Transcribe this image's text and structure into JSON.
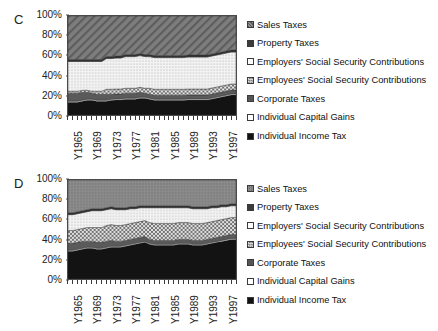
{
  "figure": {
    "panels": [
      {
        "id": "C",
        "letter": "C",
        "y_ticks": [
          "100%",
          "80%",
          "60%",
          "40%",
          "20%",
          "0%"
        ],
        "x_labels": [
          "Y1965",
          "Y1969",
          "Y1973",
          "Y1977",
          "Y1981",
          "Y1985",
          "Y1989",
          "Y1993",
          "Y1997"
        ]
      },
      {
        "id": "D",
        "letter": "D",
        "y_ticks": [
          "100%",
          "80%",
          "60%",
          "40%",
          "20%",
          "0%"
        ],
        "x_labels": [
          "Y1965",
          "Y1969",
          "Y1973",
          "Y1977",
          "Y1981",
          "Y1985",
          "Y1989",
          "Y1993",
          "Y1997"
        ]
      }
    ],
    "legend_items": [
      {
        "label": "Sales Taxes",
        "pattern": "diagonal-hatch",
        "color": "#6e6e6e"
      },
      {
        "label": "Property Taxes",
        "pattern": "solid-dark",
        "color": "#3b3b3b"
      },
      {
        "label": "Employers' Social Security Contributions",
        "pattern": "dotted-light",
        "color": "#f2f2f2"
      },
      {
        "label": "Employees' Social Security Contributions",
        "pattern": "checker",
        "color": "#a8a8a8"
      },
      {
        "label": "Corporate Taxes",
        "pattern": "solid-mid",
        "color": "#555555"
      },
      {
        "label": "Individual Capital Gains",
        "pattern": "white",
        "color": "#ffffff"
      },
      {
        "label": "Individual Income Tax",
        "pattern": "solid-black",
        "color": "#111111"
      }
    ]
  },
  "chart_data": [
    {
      "type": "area",
      "title": "C",
      "stacked": true,
      "normalized": true,
      "xlabel": "",
      "ylabel": "",
      "ylim": [
        0,
        100
      ],
      "grid": false,
      "legend_position": "right",
      "x": [
        "Y1965",
        "Y1966",
        "Y1967",
        "Y1968",
        "Y1969",
        "Y1970",
        "Y1971",
        "Y1972",
        "Y1973",
        "Y1974",
        "Y1975",
        "Y1976",
        "Y1977",
        "Y1978",
        "Y1979",
        "Y1980",
        "Y1981",
        "Y1982",
        "Y1983",
        "Y1984",
        "Y1985",
        "Y1986",
        "Y1987",
        "Y1988",
        "Y1989",
        "Y1990",
        "Y1991",
        "Y1992",
        "Y1993",
        "Y1994",
        "Y1995",
        "Y1996",
        "Y1997",
        "Y1998",
        "Y1999",
        "Y2000"
      ],
      "x_tick_labels": [
        "Y1965",
        "Y1969",
        "Y1973",
        "Y1977",
        "Y1981",
        "Y1985",
        "Y1989",
        "Y1993",
        "Y1997"
      ],
      "series": [
        {
          "name": "Individual Income Tax",
          "values": [
            13,
            13,
            13,
            14,
            15,
            15,
            14,
            14,
            14,
            15,
            15,
            15,
            16,
            16,
            16,
            17,
            17,
            16,
            15,
            15,
            15,
            15,
            15,
            15,
            15,
            15,
            15,
            15,
            15,
            15,
            16,
            17,
            18,
            19,
            20,
            20
          ]
        },
        {
          "name": "Individual Capital Gains",
          "values": [
            1,
            1,
            1,
            1,
            1,
            1,
            1,
            1,
            1,
            1,
            1,
            1,
            1,
            1,
            1,
            1,
            1,
            1,
            1,
            1,
            1,
            1,
            1,
            1,
            1,
            1,
            1,
            1,
            1,
            1,
            1,
            1,
            1,
            1,
            1,
            1
          ]
        },
        {
          "name": "Corporate Taxes",
          "values": [
            8,
            8,
            8,
            8,
            7,
            6,
            6,
            6,
            6,
            5,
            5,
            5,
            5,
            5,
            5,
            5,
            4,
            4,
            4,
            4,
            4,
            4,
            4,
            4,
            4,
            4,
            4,
            4,
            4,
            4,
            4,
            4,
            4,
            4,
            4,
            4
          ]
        },
        {
          "name": "Employees' Social Security Contributions",
          "values": [
            2,
            2,
            2,
            2,
            2,
            2,
            3,
            3,
            5,
            5,
            5,
            5,
            5,
            5,
            5,
            5,
            5,
            6,
            6,
            6,
            6,
            6,
            6,
            6,
            6,
            6,
            6,
            6,
            6,
            6,
            6,
            6,
            6,
            6,
            6,
            6
          ]
        },
        {
          "name": "Employers' Social Security Contributions",
          "values": [
            30,
            30,
            30,
            29,
            29,
            30,
            30,
            30,
            31,
            31,
            31,
            31,
            32,
            32,
            32,
            32,
            32,
            32,
            32,
            32,
            32,
            32,
            32,
            32,
            32,
            32,
            32,
            32,
            32,
            32,
            32,
            32,
            32,
            32,
            32,
            32
          ]
        },
        {
          "name": "Property Taxes",
          "values": [
            2,
            2,
            2,
            2,
            2,
            2,
            2,
            2,
            2,
            2,
            2,
            2,
            2,
            2,
            2,
            2,
            2,
            2,
            2,
            2,
            2,
            2,
            2,
            2,
            2,
            2,
            2,
            2,
            2,
            2,
            2,
            2,
            2,
            2,
            2,
            2
          ]
        },
        {
          "name": "Sales Taxes",
          "values": [
            44,
            44,
            44,
            44,
            44,
            44,
            44,
            44,
            41,
            41,
            40,
            40,
            39,
            39,
            39,
            38,
            39,
            39,
            40,
            40,
            40,
            40,
            40,
            40,
            40,
            39,
            39,
            39,
            39,
            39,
            38,
            37,
            36,
            35,
            34,
            34
          ]
        }
      ]
    },
    {
      "type": "area",
      "title": "D",
      "stacked": true,
      "normalized": true,
      "xlabel": "",
      "ylabel": "",
      "ylim": [
        0,
        100
      ],
      "grid": false,
      "legend_position": "right",
      "x": [
        "Y1965",
        "Y1966",
        "Y1967",
        "Y1968",
        "Y1969",
        "Y1970",
        "Y1971",
        "Y1972",
        "Y1973",
        "Y1974",
        "Y1975",
        "Y1976",
        "Y1977",
        "Y1978",
        "Y1979",
        "Y1980",
        "Y1981",
        "Y1982",
        "Y1983",
        "Y1984",
        "Y1985",
        "Y1986",
        "Y1987",
        "Y1988",
        "Y1989",
        "Y1990",
        "Y1991",
        "Y1992",
        "Y1993",
        "Y1994",
        "Y1995",
        "Y1996",
        "Y1997",
        "Y1998",
        "Y1999",
        "Y2000"
      ],
      "x_tick_labels": [
        "Y1965",
        "Y1969",
        "Y1973",
        "Y1977",
        "Y1981",
        "Y1985",
        "Y1989",
        "Y1993",
        "Y1997"
      ],
      "series": [
        {
          "name": "Individual Income Tax",
          "values": [
            28,
            28,
            29,
            30,
            31,
            31,
            30,
            30,
            31,
            32,
            32,
            32,
            33,
            34,
            35,
            36,
            37,
            35,
            34,
            34,
            34,
            34,
            34,
            35,
            35,
            35,
            34,
            34,
            34,
            35,
            36,
            37,
            38,
            39,
            40,
            40
          ]
        },
        {
          "name": "Individual Capital Gains",
          "values": [
            1,
            1,
            1,
            1,
            1,
            1,
            1,
            1,
            1,
            1,
            1,
            1,
            1,
            1,
            1,
            1,
            1,
            1,
            1,
            1,
            1,
            1,
            1,
            1,
            1,
            1,
            1,
            1,
            1,
            1,
            1,
            1,
            1,
            1,
            1,
            1
          ]
        },
        {
          "name": "Corporate Taxes",
          "values": [
            7,
            7,
            7,
            7,
            6,
            6,
            6,
            6,
            6,
            6,
            5,
            5,
            5,
            5,
            5,
            5,
            5,
            4,
            4,
            4,
            4,
            4,
            4,
            4,
            4,
            4,
            4,
            4,
            4,
            4,
            4,
            4,
            4,
            4,
            4,
            4
          ]
        },
        {
          "name": "Employees' Social Security Contributions",
          "values": [
            13,
            13,
            13,
            13,
            14,
            14,
            15,
            15,
            16,
            16,
            16,
            16,
            16,
            16,
            16,
            16,
            16,
            17,
            17,
            17,
            17,
            17,
            17,
            17,
            17,
            17,
            17,
            17,
            17,
            17,
            17,
            17,
            17,
            17,
            17,
            17
          ]
        },
        {
          "name": "Employers' Social Security Contributions",
          "values": [
            16,
            16,
            16,
            16,
            16,
            17,
            17,
            17,
            16,
            16,
            16,
            16,
            15,
            15,
            14,
            14,
            13,
            15,
            16,
            16,
            16,
            16,
            16,
            15,
            15,
            15,
            15,
            15,
            15,
            14,
            14,
            13,
            13,
            12,
            12,
            12
          ]
        },
        {
          "name": "Property Taxes",
          "values": [
            2,
            2,
            2,
            2,
            2,
            2,
            2,
            2,
            2,
            2,
            2,
            2,
            2,
            2,
            2,
            2,
            2,
            2,
            2,
            2,
            2,
            2,
            2,
            2,
            2,
            2,
            2,
            2,
            2,
            2,
            2,
            2,
            2,
            2,
            2,
            2
          ]
        },
        {
          "name": "Sales Taxes",
          "values": [
            33,
            33,
            32,
            31,
            30,
            29,
            29,
            29,
            28,
            27,
            28,
            28,
            28,
            27,
            27,
            26,
            26,
            26,
            26,
            26,
            26,
            26,
            26,
            26,
            26,
            26,
            27,
            27,
            27,
            27,
            26,
            26,
            25,
            25,
            24,
            24
          ]
        }
      ]
    }
  ]
}
